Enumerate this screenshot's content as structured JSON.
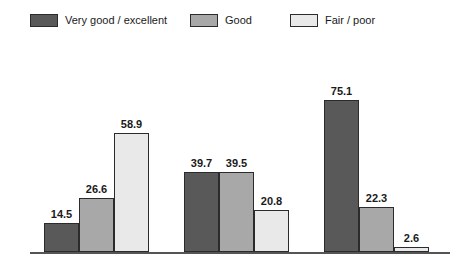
{
  "legend": {
    "items": [
      {
        "label": "Very good / excellent",
        "color": "#595959",
        "x": 30
      },
      {
        "label": "Good",
        "color": "#a8a8a8",
        "x": 190
      },
      {
        "label": "Fair / poor",
        "color": "#e9e9e9",
        "x": 290
      }
    ]
  },
  "axis": {
    "baseline_color": "#555555",
    "baseline_left": 30,
    "baseline_right": 450,
    "baseline_y": 252
  },
  "chart_data": {
    "type": "bar",
    "title": "",
    "subtitle": "",
    "xlabel": "",
    "ylabel": "",
    "ylim": [
      0,
      80
    ],
    "grid": false,
    "legend_position": "top",
    "categories": [
      "Group 1",
      "Group 2",
      "Group 3"
    ],
    "series": [
      {
        "name": "Very good / excellent",
        "color": "#595959",
        "values": [
          14.5,
          39.7,
          75.1
        ]
      },
      {
        "name": "Good",
        "color": "#a8a8a8",
        "values": [
          26.6,
          39.5,
          22.3
        ]
      },
      {
        "name": "Fair / poor",
        "color": "#e9e9e9",
        "values": [
          58.9,
          20.8,
          2.6
        ]
      }
    ],
    "data_labels": [
      [
        "14.5",
        "26.6",
        "58.9"
      ],
      [
        "39.7",
        "39.5",
        "20.8"
      ],
      [
        "75.1",
        "22.3",
        "2.6"
      ]
    ]
  }
}
